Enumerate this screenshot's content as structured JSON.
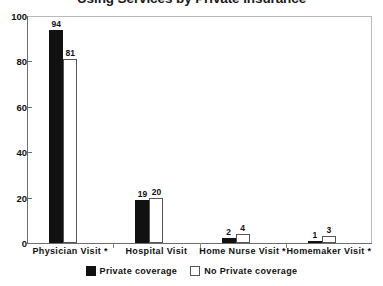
{
  "chart_data": {
    "type": "bar",
    "title": "Using Services by Private Insurance",
    "xlabel": "",
    "ylabel": "",
    "ylim": [
      0,
      100
    ],
    "yticks": [
      0,
      20,
      40,
      60,
      80,
      100
    ],
    "ytick_labels": [
      "0",
      "20",
      "40",
      "60",
      "80",
      "100"
    ],
    "grid": false,
    "legend_position": "bottom-center",
    "show_value_labels": true,
    "categories": [
      "Physician Visit *",
      "Hospital Visit",
      "Home Nurse Visit *",
      "Homemaker Visit *"
    ],
    "series": [
      {
        "name": "Private coverage",
        "style": "filled",
        "color": "#111111",
        "values": [
          94,
          19,
          2,
          1
        ],
        "value_labels": [
          "94",
          "19",
          "2",
          "1"
        ]
      },
      {
        "name": "No Private coverage",
        "style": "hollow",
        "color": "#ffffff",
        "border_color": "#555555",
        "values": [
          81,
          20,
          4,
          3
        ],
        "value_labels": [
          "81",
          "20",
          "4",
          "3"
        ]
      }
    ]
  },
  "legend": {
    "items": [
      {
        "label": "Private coverage",
        "style": "filled"
      },
      {
        "label": "No Private coverage",
        "style": "hollow"
      }
    ]
  }
}
